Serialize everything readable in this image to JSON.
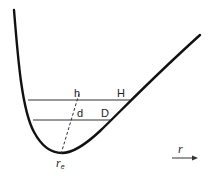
{
  "diagram": {
    "type": "potential-energy-curve",
    "labels": {
      "h": "h",
      "H": "H",
      "d": "d",
      "D": "D",
      "re_main": "r",
      "re_sub": "e",
      "r_axis": "r"
    },
    "colors": {
      "curve": "#111111",
      "lines": "#333333",
      "text": "#222222"
    }
  }
}
